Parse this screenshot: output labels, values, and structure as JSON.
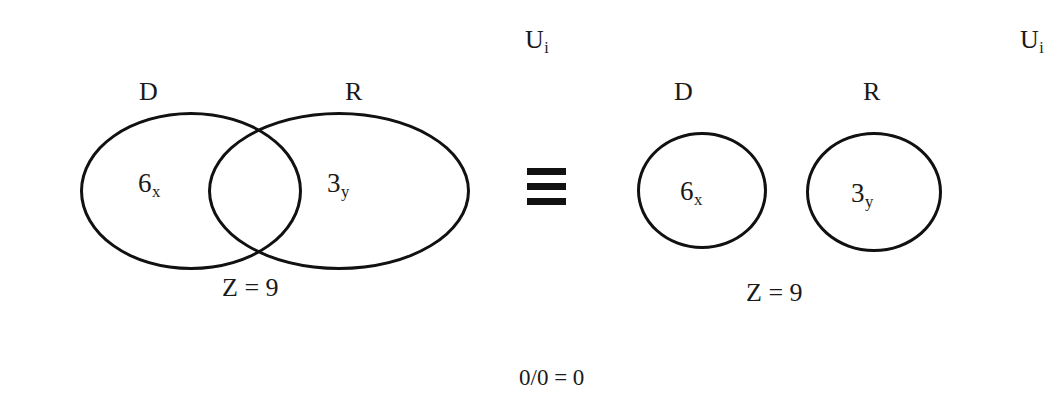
{
  "figure": {
    "relation_symbol": "identical-to",
    "bottom_note": "0/0 = 0",
    "stroke_color": "#111111",
    "background_color": "#ffffff"
  },
  "left_panel": {
    "universe_label": "U",
    "universe_subscript": "i",
    "set_d_label": "D",
    "set_r_label": "R",
    "set_d_value": "6",
    "set_d_subscript": "x",
    "set_r_value": "3",
    "set_r_subscript": "y",
    "total_label": "Z = 9",
    "arrangement": "overlapping"
  },
  "right_panel": {
    "universe_label": "U",
    "universe_subscript": "i",
    "set_d_label": "D",
    "set_r_label": "R",
    "set_d_value": "6",
    "set_d_subscript": "x",
    "set_r_value": "3",
    "set_r_subscript": "y",
    "total_label": "Z = 9",
    "arrangement": "disjoint"
  }
}
